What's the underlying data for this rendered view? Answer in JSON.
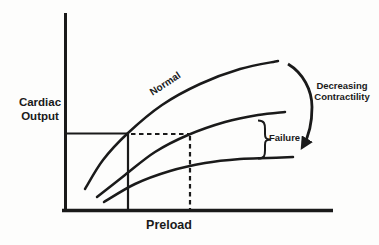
{
  "labels": {
    "ylabel_line1": "Cardiac",
    "ylabel_line2": "Output",
    "xlabel": "Preload",
    "normal": "Normal",
    "failure": "Failure",
    "decreasing_line1": "Decreasing",
    "decreasing_line2": "Contractility"
  },
  "colors": {
    "ink": "#1a1a1a",
    "background": "#fdfdfc"
  },
  "chart_data": {
    "type": "line",
    "title": "",
    "xlabel": "Preload",
    "ylabel": "Cardiac Output",
    "tick_labels": "none (qualitative sketch, unlabeled axes)",
    "grid": false,
    "legend_position": "labels drawn on figure",
    "series": [
      {
        "id": "curve-top",
        "label": "Normal",
        "points_px": [
          [
            85,
            189
          ],
          [
            103,
            160
          ],
          [
            128,
            133
          ],
          [
            162,
            105
          ],
          [
            200,
            84
          ],
          [
            240,
            69
          ],
          [
            278,
            61
          ]
        ]
      },
      {
        "id": "curve-middle",
        "label": "",
        "points_px": [
          [
            97,
            197
          ],
          [
            125,
            175
          ],
          [
            155,
            152
          ],
          [
            188,
            135
          ],
          [
            225,
            122
          ],
          [
            258,
            115
          ],
          [
            285,
            112
          ]
        ]
      },
      {
        "id": "curve-bottom",
        "label": "",
        "points_px": [
          [
            104,
            202
          ],
          [
            135,
            184
          ],
          [
            170,
            171
          ],
          [
            205,
            163
          ],
          [
            240,
            159
          ],
          [
            268,
            158
          ],
          [
            293,
            157
          ]
        ]
      }
    ],
    "annotations": [
      {
        "text": "Decreasing Contractility",
        "type": "curved-arrow",
        "meaning": "arrow sweeps from end of Normal curve down to lowest curve"
      },
      {
        "text": "Failure",
        "type": "brace",
        "meaning": "brace spans gap between middle and bottom curves at right"
      },
      {
        "type": "solid-reference-lines",
        "meaning": "output level from y-axis to Normal curve, dropped vertically to x-axis"
      },
      {
        "type": "dashed-reference-lines",
        "meaning": "same output level extended to middle curve, dropped vertically to x-axis"
      }
    ]
  }
}
